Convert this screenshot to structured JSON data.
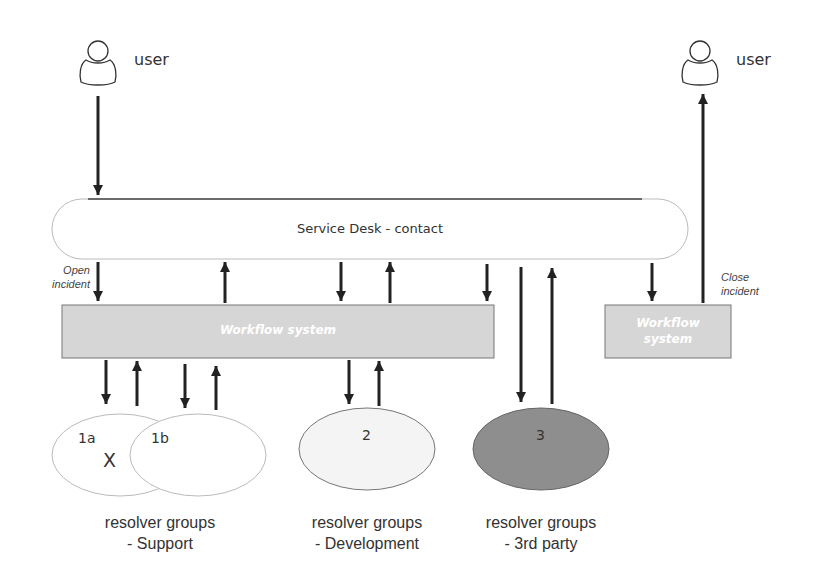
{
  "users": {
    "left_label": "user",
    "right_label": "user"
  },
  "service_desk": {
    "label": "Service Desk - contact"
  },
  "workflow": {
    "main_label": "Workflow system",
    "small_label_line1": "Workflow",
    "small_label_line2": "system"
  },
  "annotations": {
    "open_line1": "Open",
    "open_line2": "incident",
    "close_line1": "Close",
    "close_line2": "incident"
  },
  "groups": {
    "g1a": "1a",
    "g1b": "1b",
    "x_mark": "X",
    "g2": "2",
    "g3": "3"
  },
  "captions": [
    {
      "line1": "resolver groups",
      "line2": "- Support"
    },
    {
      "line1": "resolver groups",
      "line2": "- Development"
    },
    {
      "line1": "resolver groups",
      "line2": "- 3rd party"
    }
  ],
  "colors": {
    "workflow_fill": "#d6d6d6",
    "group3_fill": "#8e8e8e",
    "group2_fill": "#f4f4f4",
    "arrow": "#222222"
  }
}
